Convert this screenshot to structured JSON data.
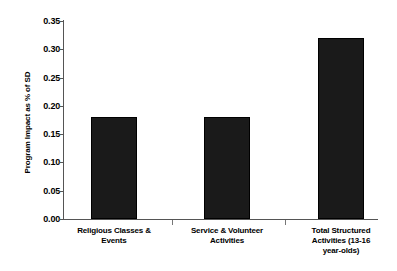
{
  "chart_data": {
    "type": "bar",
    "title": "",
    "subtitle": "",
    "xlabel": "",
    "ylabel": "Program Impact as % of SD",
    "categories": [
      "Religious Classes & Events",
      "Service & Volunteer Activities",
      "Total Structured Activities (13-16 year-olds)"
    ],
    "category_lines": [
      [
        "Religious Classes &",
        "Events"
      ],
      [
        "Service & Volunteer",
        "Activities"
      ],
      [
        "Total Structured",
        "Activities (13-16",
        "year-olds)"
      ]
    ],
    "values": [
      0.18,
      0.18,
      0.32
    ],
    "ylim": [
      0.0,
      0.35
    ],
    "ytick_values": [
      0.0,
      0.05,
      0.1,
      0.15,
      0.2,
      0.25,
      0.3,
      0.35
    ],
    "ytick_labels": [
      "0.00",
      "0.05",
      "0.10",
      "0.15",
      "0.20",
      "0.25",
      "0.30",
      "0.35"
    ],
    "grid": false,
    "legend": null,
    "legend_position": "none",
    "bar_color": "#1a1a1a",
    "axis_color": "#555555",
    "background_color": "#ffffff",
    "text_color": "#000000",
    "annotations": []
  },
  "axis": {
    "ytick_0": "0.00",
    "ytick_1": "0.05",
    "ytick_2": "0.10",
    "ytick_3": "0.15",
    "ytick_4": "0.20",
    "ytick_5": "0.25",
    "ytick_6": "0.30",
    "ytick_7": "0.35",
    "y_title": "Program Impact as % of SD"
  },
  "labels": {
    "cat0_line0": "Religious Classes &",
    "cat0_line1": "Events",
    "cat1_line0": "Service & Volunteer",
    "cat1_line1": "Activities",
    "cat2_line0": "Total Structured",
    "cat2_line1": "Activities (13-16",
    "cat2_line2": "year-olds)"
  }
}
